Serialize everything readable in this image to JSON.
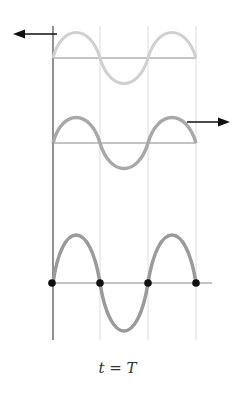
{
  "caption": {
    "var": "t",
    "eq": "=",
    "value": "T"
  },
  "colors": {
    "axis": "#555555",
    "gridline": "#d8d8d8",
    "baseline": "#888888",
    "wave_incident": "#d0d0d0",
    "wave_reflected": "#a6a6a6",
    "wave_standing": "#9a9a9a",
    "arrow": "#111111",
    "node": "#111111"
  },
  "waves": [
    {
      "name": "incident-wave",
      "direction": "left",
      "baseline_y": 58,
      "amplitude": 26
    },
    {
      "name": "reflected-wave",
      "direction": "right",
      "baseline_y": 143,
      "amplitude": 26
    },
    {
      "name": "standing-wave",
      "baseline_y": 283,
      "amplitude": 49,
      "nodes_x": [
        52,
        100,
        148,
        196
      ]
    }
  ]
}
